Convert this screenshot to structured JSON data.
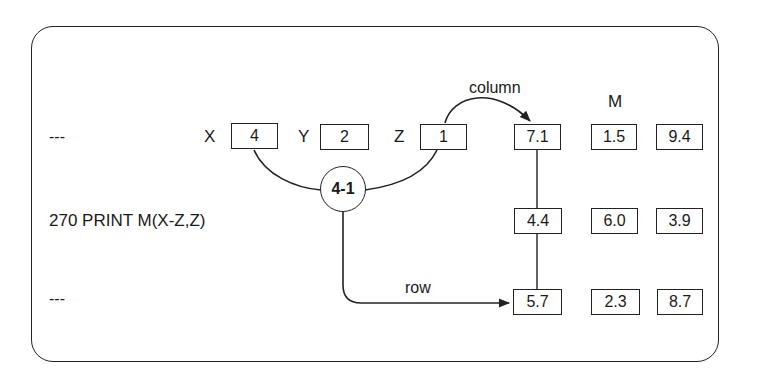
{
  "lines": {
    "top_ellipsis": "---",
    "statement": "270  PRINT M(X-Z,Z)",
    "bottom_ellipsis": "---"
  },
  "variables": [
    {
      "name": "X",
      "value": "4"
    },
    {
      "name": "Y",
      "value": "2"
    },
    {
      "name": "Z",
      "value": "1"
    }
  ],
  "operation": {
    "expression": "4-1"
  },
  "labels": {
    "column": "column",
    "row": "row",
    "matrix": "M"
  },
  "matrix": {
    "rows": [
      [
        "7.1",
        "1.5",
        "9.4"
      ],
      [
        "4.4",
        "6.0",
        "3.9"
      ],
      [
        "5.7",
        "2.3",
        "8.7"
      ]
    ]
  },
  "colors": {
    "ink": "#222222",
    "background": "#ffffff"
  }
}
